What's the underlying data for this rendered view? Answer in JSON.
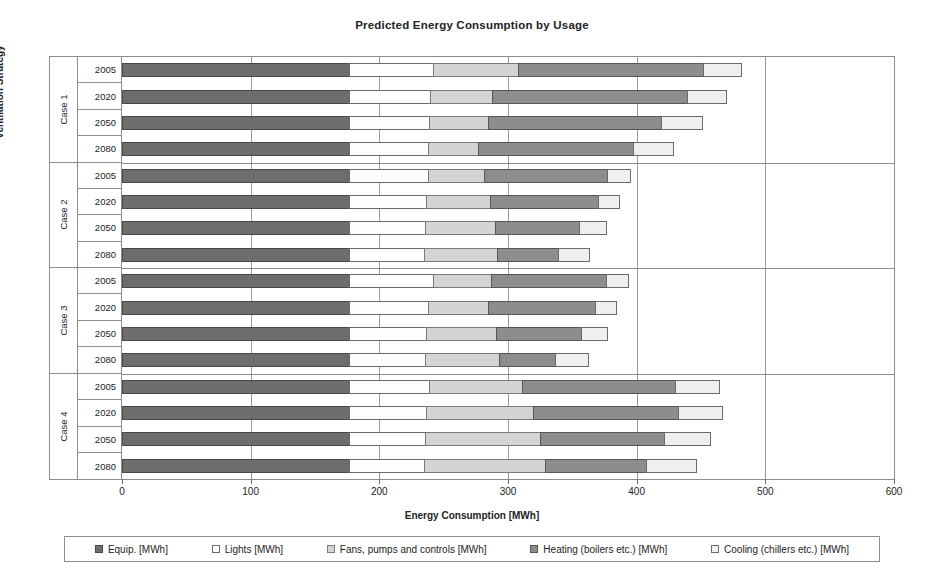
{
  "chart_data": {
    "type": "bar",
    "orientation": "horizontal",
    "stacked": true,
    "title": "Predicted Energy Consumption by Usage",
    "xlabel": "Energy Consumption [MWh]",
    "ylabel": "Ventilation Strategy",
    "xlim": [
      0,
      600
    ],
    "xticks": [
      0,
      100,
      200,
      300,
      400,
      500,
      600
    ],
    "grid": true,
    "legend_position": "bottom",
    "series": [
      {
        "name": "Equip. [MWh]",
        "key": "equip",
        "color": "#6d6d6d"
      },
      {
        "name": "Lights [MWh]",
        "key": "lights",
        "color": "#fdfdfd"
      },
      {
        "name": "Fans, pumps and controls [MWh]",
        "key": "fans",
        "color": "#d4d4d4"
      },
      {
        "name": "Heating (boilers etc.) [MWh]",
        "key": "heating",
        "color": "#8d8d8d"
      },
      {
        "name": "Cooling (chillers etc.) [MWh]",
        "key": "cooling",
        "color": "#efefef"
      }
    ],
    "groups": [
      {
        "label": "Case 1",
        "rows": [
          {
            "category": "2005",
            "values": [
              177,
              66,
              67,
              145,
              30
            ],
            "total": 485
          },
          {
            "category": "2020",
            "values": [
              177,
              64,
              49,
              152,
              31
            ],
            "total": 473
          },
          {
            "category": "2050",
            "values": [
              177,
              63,
              47,
              135,
              33
            ],
            "total": 455
          },
          {
            "category": "2080",
            "values": [
              177,
              62,
              40,
              121,
              32
            ],
            "total": 432
          }
        ]
      },
      {
        "label": "Case 2",
        "rows": [
          {
            "category": "2005",
            "values": [
              177,
              62,
              45,
              96,
              19
            ],
            "total": 399
          },
          {
            "category": "2020",
            "values": [
              177,
              61,
              50,
              85,
              17
            ],
            "total": 390
          },
          {
            "category": "2050",
            "values": [
              177,
              60,
              55,
              66,
              22
            ],
            "total": 380
          },
          {
            "category": "2080",
            "values": [
              177,
              59,
              58,
              48,
              25
            ],
            "total": 367
          }
        ]
      },
      {
        "label": "Case 3",
        "rows": [
          {
            "category": "2005",
            "values": [
              177,
              66,
              46,
              90,
              18
            ],
            "total": 397
          },
          {
            "category": "2020",
            "values": [
              177,
              62,
              48,
              84,
              17
            ],
            "total": 388
          },
          {
            "category": "2050",
            "values": [
              177,
              61,
              55,
              67,
              21
            ],
            "total": 381
          },
          {
            "category": "2080",
            "values": [
              177,
              60,
              58,
              45,
              26
            ],
            "total": 366
          }
        ]
      },
      {
        "label": "Case 4",
        "rows": [
          {
            "category": "2005",
            "values": [
              177,
              63,
              73,
              120,
              35
            ],
            "total": 468
          },
          {
            "category": "2020",
            "values": [
              177,
              61,
              84,
              113,
              35
            ],
            "total": 470
          },
          {
            "category": "2050",
            "values": [
              177,
              60,
              90,
              97,
              37
            ],
            "total": 461
          },
          {
            "category": "2080",
            "values": [
              177,
              59,
              95,
              79,
              40
            ],
            "total": 450
          }
        ]
      }
    ]
  }
}
